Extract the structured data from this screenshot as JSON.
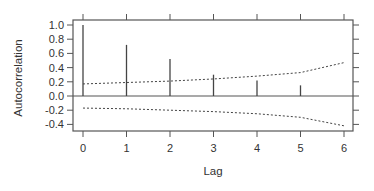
{
  "chart_data": {
    "type": "bar",
    "subtype": "acf",
    "title": "",
    "xlabel": "Lag",
    "ylabel": "Autocorrelation",
    "x": [
      0,
      1,
      2,
      3,
      4,
      5
    ],
    "values": [
      1.0,
      0.72,
      0.52,
      0.3,
      0.22,
      0.15
    ],
    "x_ticks": [
      "0",
      "1",
      "2",
      "3",
      "4",
      "5",
      "6"
    ],
    "y_ticks": [
      "1.0",
      "0.8",
      "0.6",
      "0.4",
      "0.2",
      "0.0",
      "-0.2",
      "-0.4"
    ],
    "xlim": [
      0,
      6
    ],
    "ylim": [
      -0.5,
      1.05
    ],
    "confidence_band": {
      "x": [
        0,
        1,
        2,
        3,
        4,
        5,
        6
      ],
      "upper": [
        0.17,
        0.19,
        0.21,
        0.24,
        0.28,
        0.33,
        0.47
      ],
      "lower": [
        -0.17,
        -0.18,
        -0.2,
        -0.22,
        -0.25,
        -0.3,
        -0.42
      ],
      "style": "dotted"
    },
    "grid": false,
    "legend": null,
    "reference_line": 0
  }
}
